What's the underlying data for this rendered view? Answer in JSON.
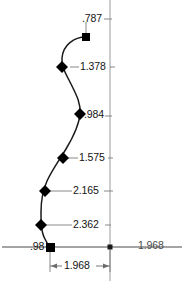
{
  "drawing": {
    "type": "cad-dimensioned-spline",
    "title": "",
    "background_color": "#ffffff",
    "line_color": "#1a1a1a",
    "dimension_line_color": "#555555",
    "reference_line_color": "#888888",
    "marker_color": "#000000",
    "axis": {
      "horizontal_label": "1.968",
      "origin_marker": "origin-dot",
      "baseline_y": 247,
      "vertical_reference_x": 110
    },
    "dimensions": [
      {
        "id": "d-787",
        "value": ".787",
        "x": 82,
        "y": 15,
        "marker": "square",
        "marker_x": 86,
        "marker_y": 37
      },
      {
        "id": "d-1378",
        "value": "1.378",
        "x": 80,
        "y": 62,
        "marker": "diamond",
        "marker_x": 68,
        "marker_y": 67
      },
      {
        "id": "d-984",
        "value": ".984",
        "x": 83,
        "y": 112,
        "marker": "diamond",
        "marker_x": 80,
        "marker_y": 114
      },
      {
        "id": "d-1575",
        "value": "1.575",
        "x": 79,
        "y": 152,
        "marker": "diamond",
        "marker_x": 63,
        "marker_y": 158
      },
      {
        "id": "d-2165",
        "value": "2.165",
        "x": 73,
        "y": 186,
        "marker": "diamond",
        "marker_x": 45,
        "marker_y": 191
      },
      {
        "id": "d-2362",
        "value": "2.362",
        "x": 73,
        "y": 219,
        "marker": "diamond",
        "marker_x": 41,
        "marker_y": 225
      },
      {
        "id": "d-98",
        "value": ".98",
        "x": 30,
        "y": 242,
        "marker": "square",
        "marker_x": 50,
        "marker_y": 247
      }
    ],
    "right_axis_label": {
      "value": "1.968",
      "x": 138,
      "y": 241
    },
    "bottom_dimension": {
      "value": "1.968",
      "x": 64,
      "y": 263,
      "from_x": 48,
      "to_x": 110,
      "y_line": 268
    }
  }
}
